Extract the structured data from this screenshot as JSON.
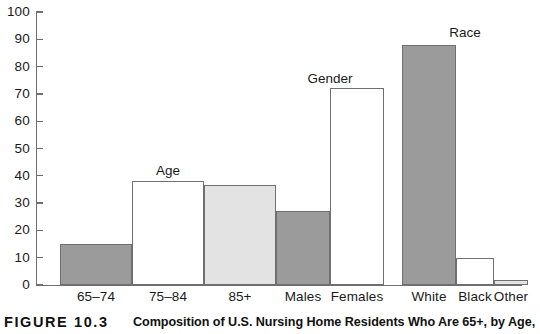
{
  "figure": {
    "label": "FIGURE 10.3",
    "caption": "Composition of U.S. Nursing Home Residents Who Are 65+, by Age,"
  },
  "axis": {
    "y_ticks": [
      "100",
      "90",
      "80",
      "70",
      "60",
      "50",
      "40",
      "30",
      "20",
      "10",
      "0"
    ],
    "y_min": 0,
    "y_max": 100,
    "y_step": 10
  },
  "groups": [
    {
      "title": "Age"
    },
    {
      "title": "Gender"
    },
    {
      "title": "Race"
    }
  ],
  "bars": [
    {
      "label": "65–74",
      "value": 15,
      "style": "dark"
    },
    {
      "label": "75–84",
      "value": 38,
      "style": "white"
    },
    {
      "label": "85+",
      "value": 36.5,
      "style": "light"
    },
    {
      "label": "Males",
      "value": 27,
      "style": "dark"
    },
    {
      "label": "Females",
      "value": 72,
      "style": "white"
    },
    {
      "label": "White",
      "value": 88,
      "style": "dark"
    },
    {
      "label": "Black",
      "value": 10,
      "style": "white"
    },
    {
      "label": "Other",
      "value": 2,
      "style": "light"
    }
  ],
  "colors": {
    "fill_dark": "#9b9b9b",
    "fill_white": "#ffffff",
    "fill_light": "#e3e3e3",
    "stroke": "#6f6f6f",
    "text": "#1a1a1a"
  },
  "chart_data": {
    "type": "bar",
    "title": "Composition of U.S. Nursing Home Residents Who Are 65+, by Age,",
    "xlabel": "",
    "ylabel": "",
    "ylim": [
      0,
      100
    ],
    "yticks": [
      0,
      10,
      20,
      30,
      40,
      50,
      60,
      70,
      80,
      90,
      100
    ],
    "grid": false,
    "legend": "none",
    "categories": [
      "65–74",
      "75–84",
      "85+",
      "Males",
      "Females",
      "White",
      "Black",
      "Other"
    ],
    "values": [
      15,
      38,
      36.5,
      27,
      72,
      88,
      10,
      2
    ],
    "group_annotations": [
      {
        "text": "Age",
        "covers": [
          "65–74",
          "75–84",
          "85+"
        ]
      },
      {
        "text": "Gender",
        "covers": [
          "Males",
          "Females"
        ]
      },
      {
        "text": "Race",
        "covers": [
          "White",
          "Black",
          "Other"
        ]
      }
    ],
    "bar_fills": [
      "dark-gray",
      "white",
      "light-gray",
      "dark-gray",
      "white",
      "dark-gray",
      "white",
      "light-gray"
    ]
  }
}
